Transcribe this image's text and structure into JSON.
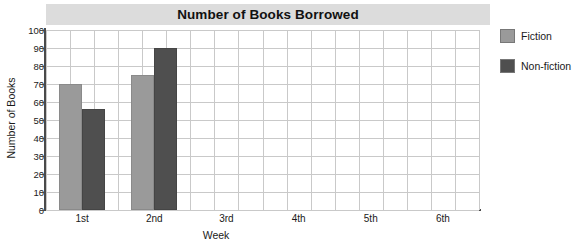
{
  "chart_data": {
    "type": "bar",
    "title": "Number of Books Borrowed",
    "xlabel": "Week",
    "ylabel": "Number of Books",
    "categories": [
      "1st",
      "2nd",
      "3rd",
      "4th",
      "5th",
      "6th"
    ],
    "series": [
      {
        "name": "Fiction",
        "color": "#9a9a9a",
        "values": [
          70,
          75,
          null,
          null,
          null,
          null
        ]
      },
      {
        "name": "Non-fiction",
        "color": "#4f4f4f",
        "values": [
          56,
          90,
          null,
          null,
          null,
          null
        ]
      }
    ],
    "ylim": [
      0,
      100
    ],
    "ytick_step": 10,
    "yticks": [
      0,
      10,
      20,
      30,
      40,
      50,
      60,
      70,
      80,
      90,
      100
    ],
    "grid": true,
    "legend_position": "right",
    "title_banner_color": "#dcdcdc",
    "gridline_color": "#c9c9c9",
    "axis_color": "#4a4a4a",
    "plot_background": "#ffffff"
  },
  "legend": {
    "items": [
      {
        "label": "Fiction"
      },
      {
        "label": "Non-fiction"
      }
    ]
  }
}
